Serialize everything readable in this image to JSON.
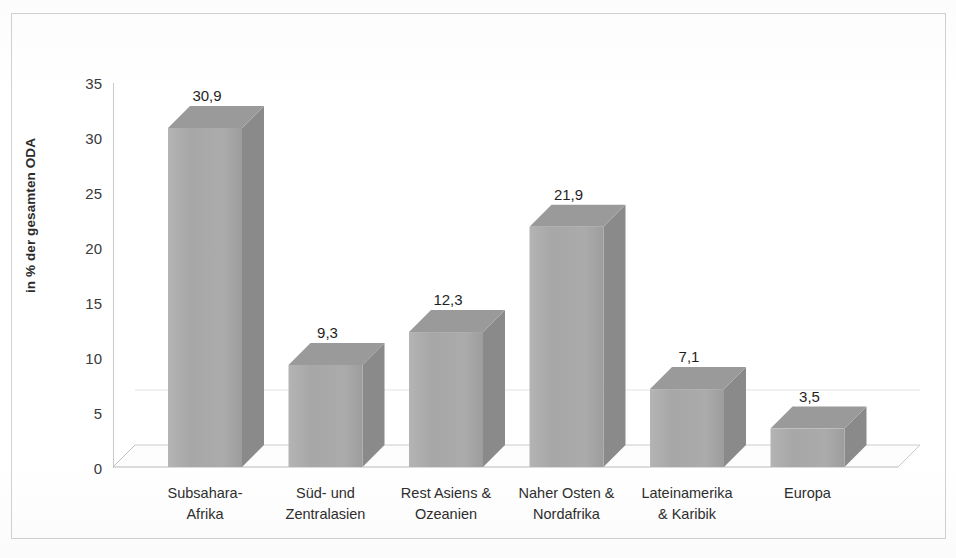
{
  "chart_data": {
    "type": "bar",
    "title": "",
    "subtitle": "",
    "xlabel": "",
    "ylabel": "in % der gesamten ODA",
    "ylim": [
      0,
      35
    ],
    "y_ticks": [
      "0",
      "5",
      "10",
      "15",
      "20",
      "25",
      "30",
      "35"
    ],
    "y_tick_values": [
      0,
      5,
      10,
      15,
      20,
      25,
      30,
      35
    ],
    "grid": false,
    "legend": "none",
    "three_d": true,
    "decimal_separator": ",",
    "categories": [
      "Subsahara-\nAfrika",
      "Süd- und\nZentralasien",
      "Rest Asiens &\nOzeanien",
      "Naher Osten &\nNordafrika",
      "Lateinamerika\n& Karibik",
      "Europa"
    ],
    "values": [
      30.9,
      9.3,
      12.3,
      21.9,
      7.1,
      3.5
    ],
    "data_labels": [
      "30,9",
      "9,3",
      "12,3",
      "21,9",
      "7,1",
      "3,5"
    ],
    "bar_face_color": "#a9a9a9",
    "bar_side_color": "#8a8a8a",
    "bar_top_color": "#9a9a9a",
    "axis_color": "#c9c9c9",
    "text_color": "#2b2b2b",
    "background_color": "#ffffff"
  },
  "axis": {
    "y_title": "in % der gesamten ODA",
    "ticks": [
      {
        "label": "35"
      },
      {
        "label": "30"
      },
      {
        "label": "25"
      },
      {
        "label": "20"
      },
      {
        "label": "15"
      },
      {
        "label": "10"
      },
      {
        "label": "5"
      },
      {
        "label": "0"
      }
    ]
  },
  "bars": [
    {
      "label_line1": "Subsahara-",
      "label_line2": "Afrika",
      "value_label": "30,9"
    },
    {
      "label_line1": "Süd- und",
      "label_line2": "Zentralasien",
      "value_label": "9,3"
    },
    {
      "label_line1": "Rest Asiens &",
      "label_line2": "Ozeanien",
      "value_label": "12,3"
    },
    {
      "label_line1": "Naher Osten &",
      "label_line2": "Nordafrika",
      "value_label": "21,9"
    },
    {
      "label_line1": "Lateinamerika",
      "label_line2": "& Karibik",
      "value_label": "7,1"
    },
    {
      "label_line1": "Europa",
      "label_line2": "",
      "value_label": "3,5"
    }
  ]
}
